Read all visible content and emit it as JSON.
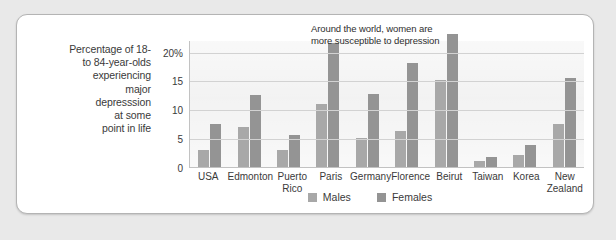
{
  "axis_caption": "Percentage of 18-\nto 84-year-olds\nexperiencing\nmajor\ndepresssion\nat some\npoint in life",
  "annotation": "Around the world, women are more susceptible to depression",
  "legend": {
    "males_label": "Males",
    "females_label": "Females"
  },
  "colors": {
    "males": "#a8a8a8",
    "females": "#949494",
    "plot_background": "#f1f1f1",
    "gridline": "#d2d2d2",
    "card_background": "#ffffff",
    "page_background": "#e9e9e9"
  },
  "chart_data": {
    "type": "bar",
    "title": "",
    "xlabel": "",
    "ylabel": "Percentage of 18- to 84-year-olds experiencing major depresssion at some point in life",
    "ylim": [
      0,
      22
    ],
    "yticks": [
      0,
      5,
      10,
      15,
      20
    ],
    "ytick_labels": [
      "0",
      "5",
      "10",
      "15",
      "20%"
    ],
    "grid": true,
    "legend_position": "bottom-center",
    "annotations": [
      "Around the world, women are more susceptible to depression"
    ],
    "categories": [
      "USA",
      "Edmonton",
      "Puerto Rico",
      "Paris",
      "Germany",
      "Florence",
      "Beirut",
      "Taiwan",
      "Korea",
      "New Zealand"
    ],
    "series": [
      {
        "name": "Males",
        "values": [
          3.0,
          7.0,
          3.0,
          11.0,
          5.0,
          6.3,
          15.0,
          1.0,
          2.0,
          7.5
        ]
      },
      {
        "name": "Females",
        "values": [
          7.5,
          12.5,
          5.5,
          21.5,
          12.7,
          18.0,
          23.0,
          1.7,
          3.8,
          15.5
        ]
      }
    ]
  }
}
